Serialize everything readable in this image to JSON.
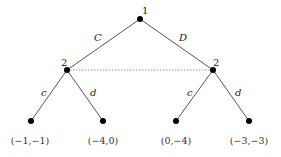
{
  "tree": {
    "root": {
      "player": "1"
    },
    "actions_p1": {
      "left": "C",
      "right": "D"
    },
    "p2_nodes": {
      "left_player": "2",
      "right_player": "2"
    },
    "actions_p2": {
      "ll": "c",
      "lr": "d",
      "rl": "c",
      "rr": "d"
    },
    "payoffs": [
      "(−1,−1)",
      "(−4,0)",
      "(0,−4)",
      "(−3,−3)"
    ],
    "information_set": "dotted line connecting player 2 nodes"
  }
}
